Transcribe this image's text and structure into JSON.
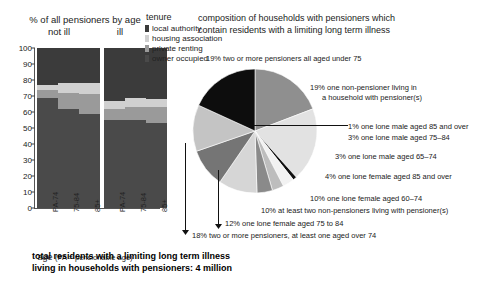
{
  "bar_chart": {
    "title": "% of all pensioners by age",
    "group_labels": [
      "not ill",
      "ill"
    ],
    "xaxis_caption_main": "age",
    "xaxis_caption_note": "(PA = pensionable age)",
    "yticks": [
      "100",
      "90",
      "80",
      "70",
      "60",
      "50",
      "40",
      "30",
      "20",
      "10",
      "0"
    ]
  },
  "legend": {
    "title": "tenure",
    "items": [
      {
        "label": "local authority",
        "color": "#3b3b3b"
      },
      {
        "label": "housing association",
        "color": "#d0d0d0"
      },
      {
        "label": "private renting",
        "color": "#9a9a9a"
      },
      {
        "label": "owner occupied",
        "color": "#4a4a4a"
      }
    ]
  },
  "pie_title_line1": "composition of households with pensioners which",
  "pie_title_line2": "contain residents with a limiting long term illness",
  "footer_line1": "total residents with a limiting long term illness",
  "footer_line2": "living in households with pensioners: 4 million",
  "callouts": {
    "c19_under75": "19% two or more pensioners all aged under 75",
    "c19_nonpensioner_l1": "19% one non-pensioner living in",
    "c19_nonpensioner_l2": "a household with pensioner(s)",
    "c1_male85": "1% one lone male aged 85 and over",
    "c3_male7584": "3% one lone male aged 75–84",
    "c3_male6574": "3% one lone male aged 65–74",
    "c4_female85": "4% one lone female aged 85 and over",
    "c10_female6074": "10% one lone female aged 60–74",
    "c10_twononpens": "10% at least two non-pensioners living with pensioner(s)",
    "c12_female7584": "12% one lone female aged 75 to 84",
    "c18_twopens": "18% two or more pensioners, at least one aged over 74"
  },
  "chart_data": [
    {
      "type": "bar",
      "subtype": "stacked-column",
      "title": "% of all pensioners by age",
      "xlabel": "age (PA = pensionable age)",
      "ylabel": "",
      "ylim": [
        0,
        100
      ],
      "yticks": [
        0,
        10,
        20,
        30,
        40,
        50,
        60,
        70,
        80,
        90,
        100
      ],
      "grid": false,
      "legend_position": "top-right",
      "groups": [
        "not ill",
        "ill"
      ],
      "categories": [
        "PA-74",
        "75-84",
        "85+",
        "PA-74",
        "75-84",
        "85+"
      ],
      "series": [
        {
          "name": "owner occupied",
          "color": "#4a4a4a",
          "values": [
            69,
            62,
            59,
            55,
            55,
            53
          ]
        },
        {
          "name": "private renting",
          "color": "#9a9a9a",
          "values": [
            5,
            10,
            12,
            7,
            8,
            10
          ]
        },
        {
          "name": "housing association",
          "color": "#d0d0d0",
          "values": [
            3,
            6,
            7,
            5,
            6,
            5
          ]
        },
        {
          "name": "local authority",
          "color": "#3b3b3b",
          "values": [
            23,
            22,
            22,
            33,
            31,
            32
          ]
        }
      ]
    },
    {
      "type": "pie",
      "title": "composition of households with pensioners which contain residents with a limiting long term illness",
      "total_label": "total residents with a limiting long term illness living in households with pensioners: 4 million",
      "labels": [
        "19% two or more pensioners all aged under 75",
        "19% one non-pensioner living in a household with pensioner(s)",
        "1% one lone male aged 85 and over",
        "3% one lone male aged 75–84",
        "3% one lone male aged 65–74",
        "4% one lone female aged 85 and over",
        "10% one lone female aged 60–74",
        "10% at least two non-pensioners living with pensioner(s)",
        "12% one lone female aged 75 to 84",
        "18% two or more pensioners, at least one aged over 74"
      ],
      "values": [
        19,
        19,
        1,
        3,
        3,
        4,
        10,
        10,
        12,
        18
      ],
      "colors": [
        "#8f8f8f",
        "#e2e2e2",
        "#111111",
        "#f2f2f2",
        "#bdbdbd",
        "#8a8a8a",
        "#d6d6d6",
        "#757575",
        "#c4c4c4",
        "#0d0d0d"
      ]
    }
  ]
}
